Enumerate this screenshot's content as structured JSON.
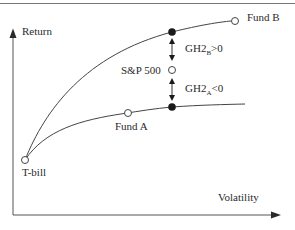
{
  "diagram": {
    "type": "efficient-frontier",
    "axes": {
      "y_label": "Return",
      "x_label": "Volatility"
    },
    "points": {
      "tbill": "T-bill",
      "fund_a": "Fund A",
      "fund_b": "Fund B",
      "sp500": "S&P 500"
    },
    "annotations": {
      "gh2b": {
        "prefix": "GH2",
        "sub": "B",
        "suffix": ">0"
      },
      "gh2a": {
        "prefix": "GH2",
        "sub": "A",
        "suffix": "<0"
      }
    },
    "colors": {
      "line": "#3a3a3a",
      "text": "#2a2a2a",
      "background": "#ffffff"
    }
  }
}
